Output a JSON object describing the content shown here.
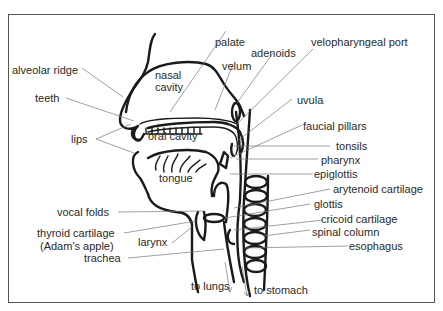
{
  "diagram": {
    "colors": {
      "line": "#1a1a1a",
      "leader": "#777777",
      "text": "#2a2a2a",
      "background": "#ffffff"
    },
    "labels": {
      "alveolar_ridge": "alveolar ridge",
      "teeth": "teeth",
      "lips": "lips",
      "nasal_cavity_1": "nasal",
      "nasal_cavity_2": "cavity",
      "oral_cavity": "oral cavity",
      "tongue": "tongue",
      "palate": "palate",
      "adenoids": "adenoids",
      "velum": "velum",
      "velopharyngeal_port": "velopharyngeal port",
      "uvula": "uvula",
      "faucial_pillars": "faucial pillars",
      "tonsils": "tonsils",
      "pharynx": "pharynx",
      "epiglottis": "epiglottis",
      "arytenoid_cartilage": "arytenoid cartilage",
      "glottis": "glottis",
      "cricoid_cartilage": "cricoid cartilage",
      "spinal_column": "spinal column",
      "esophagus": "esophagus",
      "vocal_folds": "vocal folds",
      "thyroid_cartilage_1": "thyroid cartilage",
      "thyroid_cartilage_2": "(Adam's apple)",
      "larynx": "larynx",
      "trachea": "trachea",
      "to_lungs": "to lungs",
      "to_stomach": "to stomach"
    }
  }
}
